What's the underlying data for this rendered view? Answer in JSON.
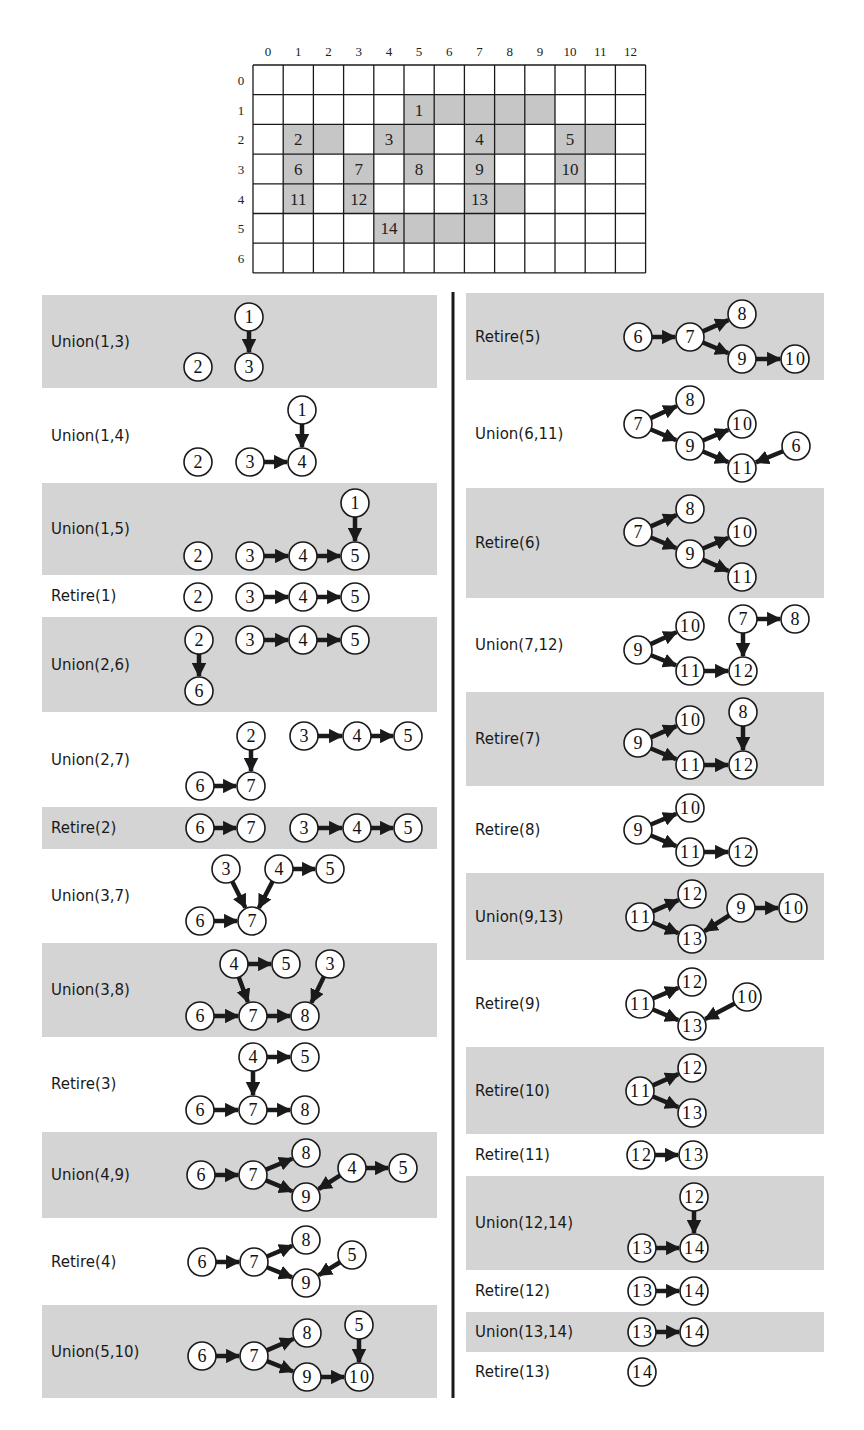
{
  "colors": {
    "panel_gray": "#d4d4d4",
    "cell_gray": "#c6c6c6",
    "line": "#1a1a1a",
    "node_fill": "#ffffff"
  },
  "grid": {
    "origin_x": 253,
    "origin_y": 65,
    "cell_w": 30.2,
    "cell_h": 29.7,
    "cols": 13,
    "rows": 7,
    "col_labels": [
      "0",
      "1",
      "2",
      "3",
      "4",
      "5",
      "6",
      "7",
      "8",
      "9",
      "10",
      "11",
      "12"
    ],
    "row_labels": [
      "0",
      "1",
      "2",
      "3",
      "4",
      "5",
      "6"
    ],
    "shaded_cells": [
      [
        1,
        5,
        "1"
      ],
      [
        1,
        6,
        ""
      ],
      [
        1,
        7,
        ""
      ],
      [
        1,
        8,
        ""
      ],
      [
        1,
        9,
        ""
      ],
      [
        2,
        1,
        "2"
      ],
      [
        2,
        2,
        ""
      ],
      [
        2,
        4,
        "3"
      ],
      [
        2,
        5,
        ""
      ],
      [
        2,
        7,
        "4"
      ],
      [
        2,
        8,
        ""
      ],
      [
        2,
        10,
        "5"
      ],
      [
        2,
        11,
        ""
      ],
      [
        3,
        1,
        "6"
      ],
      [
        3,
        3,
        "7"
      ],
      [
        3,
        5,
        "8"
      ],
      [
        3,
        7,
        "9"
      ],
      [
        3,
        10,
        "10"
      ],
      [
        4,
        1,
        "11"
      ],
      [
        4,
        3,
        "12"
      ],
      [
        4,
        7,
        "13"
      ],
      [
        4,
        8,
        ""
      ],
      [
        5,
        4,
        "14"
      ],
      [
        5,
        5,
        ""
      ],
      [
        5,
        6,
        ""
      ],
      [
        5,
        7,
        ""
      ]
    ]
  },
  "divider": {
    "x": 453,
    "y1": 292,
    "y2": 1398
  },
  "panels": [
    {
      "label": "Union(1,3)",
      "x": 42,
      "y": 295,
      "w": 395,
      "h": 93,
      "shaded": true,
      "nodes": [
        [
          "1",
          249,
          317
        ],
        [
          "2",
          198,
          367
        ],
        [
          "3",
          249,
          367
        ]
      ],
      "edges": [
        [
          "1",
          "3"
        ]
      ]
    },
    {
      "label": "Union(1,4)",
      "x": 42,
      "y": 388,
      "w": 395,
      "h": 95,
      "shaded": false,
      "nodes": [
        [
          "1",
          302,
          410
        ],
        [
          "2",
          198,
          462
        ],
        [
          "3",
          250,
          462
        ],
        [
          "4",
          302,
          462
        ]
      ],
      "edges": [
        [
          "1",
          "4"
        ],
        [
          "3",
          "4"
        ]
      ]
    },
    {
      "label": "Union(1,5)",
      "x": 42,
      "y": 483,
      "w": 395,
      "h": 92,
      "shaded": true,
      "nodes": [
        [
          "1",
          355,
          503
        ],
        [
          "2",
          198,
          556
        ],
        [
          "3",
          250,
          556
        ],
        [
          "4",
          303,
          556
        ],
        [
          "5",
          355,
          556
        ]
      ],
      "edges": [
        [
          "1",
          "5"
        ],
        [
          "3",
          "4"
        ],
        [
          "4",
          "5"
        ]
      ]
    },
    {
      "label": "Retire(1)",
      "x": 42,
      "y": 575,
      "w": 395,
      "h": 42,
      "shaded": false,
      "nodes": [
        [
          "2",
          198,
          597
        ],
        [
          "3",
          250,
          597
        ],
        [
          "4",
          303,
          597
        ],
        [
          "5",
          355,
          597
        ]
      ],
      "edges": [
        [
          "3",
          "4"
        ],
        [
          "4",
          "5"
        ]
      ]
    },
    {
      "label": "Union(2,6)",
      "x": 42,
      "y": 617,
      "w": 395,
      "h": 95,
      "shaded": true,
      "nodes": [
        [
          "2",
          199,
          640
        ],
        [
          "3",
          250,
          640
        ],
        [
          "4",
          303,
          640
        ],
        [
          "5",
          355,
          640
        ],
        [
          "6",
          199,
          691
        ]
      ],
      "edges": [
        [
          "2",
          "6"
        ],
        [
          "3",
          "4"
        ],
        [
          "4",
          "5"
        ]
      ]
    },
    {
      "label": "Union(2,7)",
      "x": 42,
      "y": 712,
      "w": 395,
      "h": 95,
      "shaded": false,
      "nodes": [
        [
          "2",
          251,
          736
        ],
        [
          "3",
          304,
          736
        ],
        [
          "4",
          357,
          736
        ],
        [
          "5",
          408,
          736
        ],
        [
          "6",
          200,
          786
        ],
        [
          "7",
          251,
          786
        ]
      ],
      "edges": [
        [
          "2",
          "7"
        ],
        [
          "6",
          "7"
        ],
        [
          "3",
          "4"
        ],
        [
          "4",
          "5"
        ]
      ]
    },
    {
      "label": "Retire(2)",
      "x": 42,
      "y": 807,
      "w": 395,
      "h": 42,
      "shaded": true,
      "nodes": [
        [
          "6",
          200,
          828
        ],
        [
          "7",
          251,
          828
        ],
        [
          "3",
          304,
          828
        ],
        [
          "4",
          357,
          828
        ],
        [
          "5",
          408,
          828
        ]
      ],
      "edges": [
        [
          "6",
          "7"
        ],
        [
          "3",
          "4"
        ],
        [
          "4",
          "5"
        ]
      ]
    },
    {
      "label": "Union(3,7)",
      "x": 42,
      "y": 849,
      "w": 395,
      "h": 94,
      "shaded": false,
      "nodes": [
        [
          "3",
          226,
          869
        ],
        [
          "4",
          279,
          869
        ],
        [
          "5",
          330,
          869
        ],
        [
          "6",
          200,
          921
        ],
        [
          "7",
          252,
          921
        ]
      ],
      "edges": [
        [
          "3",
          "7"
        ],
        [
          "4",
          "7"
        ],
        [
          "6",
          "7"
        ],
        [
          "4",
          "5"
        ]
      ]
    },
    {
      "label": "Union(3,8)",
      "x": 42,
      "y": 943,
      "w": 395,
      "h": 94,
      "shaded": true,
      "nodes": [
        [
          "4",
          234,
          964
        ],
        [
          "5",
          286,
          964
        ],
        [
          "3",
          330,
          964
        ],
        [
          "6",
          200,
          1016
        ],
        [
          "7",
          253,
          1016
        ],
        [
          "8",
          305,
          1016
        ]
      ],
      "edges": [
        [
          "4",
          "7"
        ],
        [
          "4",
          "5"
        ],
        [
          "3",
          "8"
        ],
        [
          "6",
          "7"
        ],
        [
          "7",
          "8"
        ]
      ]
    },
    {
      "label": "Retire(3)",
      "x": 42,
      "y": 1037,
      "w": 395,
      "h": 94,
      "shaded": false,
      "nodes": [
        [
          "4",
          253,
          1057
        ],
        [
          "5",
          305,
          1057
        ],
        [
          "6",
          200,
          1110
        ],
        [
          "7",
          253,
          1110
        ],
        [
          "8",
          305,
          1110
        ]
      ],
      "edges": [
        [
          "4",
          "7"
        ],
        [
          "4",
          "5"
        ],
        [
          "6",
          "7"
        ],
        [
          "7",
          "8"
        ]
      ]
    },
    {
      "label": "Union(4,9)",
      "x": 42,
      "y": 1132,
      "w": 395,
      "h": 86,
      "shaded": true,
      "nodes": [
        [
          "6",
          201,
          1175
        ],
        [
          "7",
          253,
          1175
        ],
        [
          "8",
          306,
          1153
        ],
        [
          "9",
          306,
          1197
        ],
        [
          "4",
          352,
          1168
        ],
        [
          "5",
          403,
          1168
        ]
      ],
      "edges": [
        [
          "6",
          "7"
        ],
        [
          "7",
          "8"
        ],
        [
          "7",
          "9"
        ],
        [
          "4",
          "9"
        ],
        [
          "4",
          "5"
        ]
      ]
    },
    {
      "label": "Retire(4)",
      "x": 42,
      "y": 1218,
      "w": 395,
      "h": 87,
      "shaded": false,
      "nodes": [
        [
          "6",
          202,
          1262
        ],
        [
          "7",
          254,
          1262
        ],
        [
          "8",
          306,
          1240
        ],
        [
          "9",
          306,
          1283
        ],
        [
          "5",
          352,
          1255
        ]
      ],
      "edges": [
        [
          "6",
          "7"
        ],
        [
          "7",
          "8"
        ],
        [
          "7",
          "9"
        ],
        [
          "5",
          "9"
        ]
      ]
    },
    {
      "label": "Union(5,10)",
      "x": 42,
      "y": 1305,
      "w": 395,
      "h": 93,
      "shaded": true,
      "nodes": [
        [
          "6",
          202,
          1356
        ],
        [
          "7",
          254,
          1356
        ],
        [
          "8",
          307,
          1333
        ],
        [
          "9",
          307,
          1377
        ],
        [
          "5",
          359,
          1325
        ],
        [
          "10",
          359,
          1377
        ]
      ],
      "edges": [
        [
          "6",
          "7"
        ],
        [
          "7",
          "8"
        ],
        [
          "7",
          "9"
        ],
        [
          "9",
          "10"
        ],
        [
          "5",
          "10"
        ]
      ]
    },
    {
      "label": "Retire(5)",
      "x": 466,
      "y": 293,
      "w": 358,
      "h": 87,
      "shaded": true,
      "nodes": [
        [
          "6",
          638,
          337
        ],
        [
          "7",
          690,
          337
        ],
        [
          "8",
          742,
          314
        ],
        [
          "9",
          742,
          359
        ],
        [
          "10",
          795,
          359
        ]
      ],
      "edges": [
        [
          "6",
          "7"
        ],
        [
          "7",
          "8"
        ],
        [
          "7",
          "9"
        ],
        [
          "9",
          "10"
        ]
      ]
    },
    {
      "label": "Union(6,11)",
      "x": 466,
      "y": 380,
      "w": 358,
      "h": 108,
      "shaded": false,
      "nodes": [
        [
          "7",
          638,
          424
        ],
        [
          "8",
          690,
          400
        ],
        [
          "9",
          690,
          446
        ],
        [
          "10",
          742,
          424
        ],
        [
          "11",
          742,
          468
        ],
        [
          "6",
          796,
          446
        ]
      ],
      "edges": [
        [
          "7",
          "8"
        ],
        [
          "7",
          "9"
        ],
        [
          "9",
          "10"
        ],
        [
          "9",
          "11"
        ],
        [
          "6",
          "11"
        ]
      ]
    },
    {
      "label": "Retire(6)",
      "x": 466,
      "y": 488,
      "w": 358,
      "h": 110,
      "shaded": true,
      "nodes": [
        [
          "7",
          638,
          532
        ],
        [
          "8",
          690,
          509
        ],
        [
          "9",
          690,
          554
        ],
        [
          "10",
          742,
          532
        ],
        [
          "11",
          742,
          577
        ]
      ],
      "edges": [
        [
          "7",
          "8"
        ],
        [
          "7",
          "9"
        ],
        [
          "9",
          "10"
        ],
        [
          "9",
          "11"
        ]
      ]
    },
    {
      "label": "Union(7,12)",
      "x": 466,
      "y": 598,
      "w": 358,
      "h": 94,
      "shaded": false,
      "nodes": [
        [
          "9",
          638,
          650
        ],
        [
          "10",
          690,
          626
        ],
        [
          "11",
          690,
          671
        ],
        [
          "7",
          743,
          619
        ],
        [
          "8",
          795,
          619
        ],
        [
          "12",
          743,
          671
        ]
      ],
      "edges": [
        [
          "9",
          "10"
        ],
        [
          "9",
          "11"
        ],
        [
          "11",
          "12"
        ],
        [
          "7",
          "12"
        ],
        [
          "7",
          "8"
        ]
      ]
    },
    {
      "label": "Retire(7)",
      "x": 466,
      "y": 692,
      "w": 358,
      "h": 94,
      "shaded": true,
      "nodes": [
        [
          "9",
          638,
          743
        ],
        [
          "10",
          690,
          720
        ],
        [
          "11",
          690,
          765
        ],
        [
          "8",
          743,
          712
        ],
        [
          "12",
          743,
          765
        ]
      ],
      "edges": [
        [
          "9",
          "10"
        ],
        [
          "9",
          "11"
        ],
        [
          "11",
          "12"
        ],
        [
          "8",
          "12"
        ]
      ]
    },
    {
      "label": "Retire(8)",
      "x": 466,
      "y": 786,
      "w": 358,
      "h": 87,
      "shaded": false,
      "nodes": [
        [
          "9",
          638,
          830
        ],
        [
          "10",
          690,
          808
        ],
        [
          "11",
          690,
          852
        ],
        [
          "12",
          743,
          852
        ]
      ],
      "edges": [
        [
          "9",
          "10"
        ],
        [
          "9",
          "11"
        ],
        [
          "11",
          "12"
        ]
      ]
    },
    {
      "label": "Union(9,13)",
      "x": 466,
      "y": 873,
      "w": 358,
      "h": 87,
      "shaded": true,
      "nodes": [
        [
          "11",
          640,
          917
        ],
        [
          "12",
          692,
          894
        ],
        [
          "13",
          692,
          939
        ],
        [
          "9",
          741,
          908
        ],
        [
          "10",
          793,
          908
        ]
      ],
      "edges": [
        [
          "11",
          "12"
        ],
        [
          "11",
          "13"
        ],
        [
          "9",
          "13"
        ],
        [
          "9",
          "10"
        ]
      ]
    },
    {
      "label": "Retire(9)",
      "x": 466,
      "y": 960,
      "w": 358,
      "h": 87,
      "shaded": false,
      "nodes": [
        [
          "11",
          640,
          1004
        ],
        [
          "12",
          692,
          982
        ],
        [
          "13",
          692,
          1026
        ],
        [
          "10",
          747,
          997
        ]
      ],
      "edges": [
        [
          "11",
          "12"
        ],
        [
          "11",
          "13"
        ],
        [
          "10",
          "13"
        ]
      ]
    },
    {
      "label": "Retire(10)",
      "x": 466,
      "y": 1047,
      "w": 358,
      "h": 87,
      "shaded": true,
      "nodes": [
        [
          "11",
          640,
          1091
        ],
        [
          "12",
          692,
          1068
        ],
        [
          "13",
          692,
          1113
        ]
      ],
      "edges": [
        [
          "11",
          "12"
        ],
        [
          "11",
          "13"
        ]
      ]
    },
    {
      "label": "Retire(11)",
      "x": 466,
      "y": 1134,
      "w": 358,
      "h": 42,
      "shaded": false,
      "nodes": [
        [
          "12",
          641,
          1155
        ],
        [
          "13",
          693,
          1155
        ]
      ],
      "edges": [
        [
          "12",
          "13"
        ]
      ]
    },
    {
      "label": "Union(12,14)",
      "x": 466,
      "y": 1176,
      "w": 358,
      "h": 94,
      "shaded": true,
      "nodes": [
        [
          "12",
          694,
          1197
        ],
        [
          "13",
          642,
          1248
        ],
        [
          "14",
          694,
          1248
        ]
      ],
      "edges": [
        [
          "12",
          "14"
        ],
        [
          "13",
          "14"
        ]
      ]
    },
    {
      "label": "Retire(12)",
      "x": 466,
      "y": 1270,
      "w": 358,
      "h": 42,
      "shaded": false,
      "nodes": [
        [
          "13",
          642,
          1291
        ],
        [
          "14",
          694,
          1291
        ]
      ],
      "edges": [
        [
          "13",
          "14"
        ]
      ]
    },
    {
      "label": "Union(13,14)",
      "x": 466,
      "y": 1312,
      "w": 358,
      "h": 40,
      "shaded": true,
      "nodes": [
        [
          "13",
          642,
          1332
        ],
        [
          "14",
          694,
          1332
        ]
      ],
      "edges": [
        [
          "13",
          "14"
        ]
      ]
    },
    {
      "label": "Retire(13)",
      "x": 466,
      "y": 1352,
      "w": 358,
      "h": 40,
      "shaded": false,
      "nodes": [
        [
          "14",
          642,
          1372
        ]
      ],
      "edges": []
    }
  ]
}
